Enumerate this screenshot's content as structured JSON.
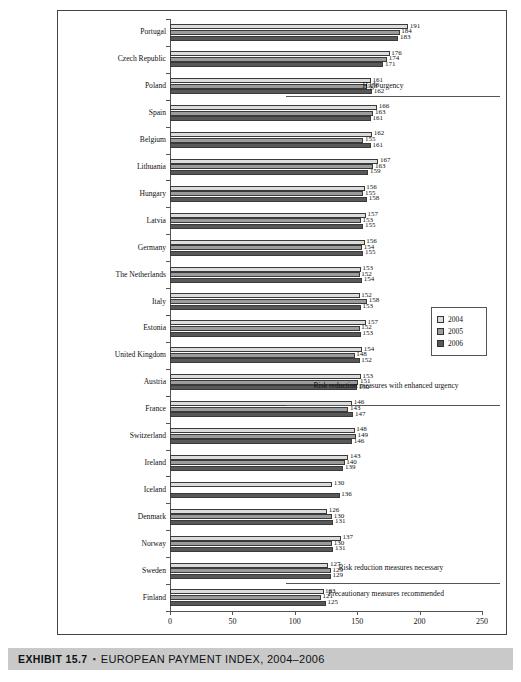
{
  "caption": {
    "exhibit_label": "EXHIBIT 15.7",
    "separator": "▪",
    "title": "EUROPEAN PAYMENT INDEX, 2004–2006"
  },
  "legend": {
    "position": "right-middle",
    "items": [
      {
        "label": "2004",
        "color": "#dcdcdc"
      },
      {
        "label": "2005",
        "color": "#9c9c9c"
      },
      {
        "label": "2006",
        "color": "#585858"
      }
    ]
  },
  "annotations": [
    {
      "name": "high-urgency",
      "text": "High urgency"
    },
    {
      "name": "risk-reduction-enhanced",
      "text": "Risk reduction measures with enhanced urgency"
    },
    {
      "name": "risk-reduction-necessary",
      "text": "Risk reduction measures necessary"
    },
    {
      "name": "precautionary",
      "text": "Precautionary measures recommended"
    }
  ],
  "chart_data": {
    "type": "bar",
    "orientation": "horizontal",
    "xlabel": "",
    "ylabel": "",
    "xlim": [
      0,
      250
    ],
    "xticks": [
      0,
      50,
      100,
      150,
      200,
      250
    ],
    "grid": false,
    "legend_position": "right",
    "categories": [
      "Portugal",
      "Czech Republic",
      "Poland",
      "Spain",
      "Belgium",
      "Lithuania",
      "Hungary",
      "Latvia",
      "Germany",
      "The Netherlands",
      "Italy",
      "Estonia",
      "United Kingdom",
      "Austria",
      "France",
      "Switzerland",
      "Ireland",
      "Iceland",
      "Denmark",
      "Norway",
      "Sweden",
      "Finland"
    ],
    "series": [
      {
        "name": "2004",
        "color": "#dcdcdc",
        "values": [
          191,
          176,
          161,
          166,
          162,
          167,
          156,
          157,
          156,
          153,
          152,
          157,
          154,
          153,
          146,
          148,
          143,
          130,
          126,
          137,
          127,
          123
        ]
      },
      {
        "name": "2005",
        "color": "#9c9c9c",
        "values": [
          184,
          174,
          158,
          163,
          155,
          163,
          155,
          153,
          154,
          152,
          158,
          152,
          148,
          151,
          143,
          149,
          140,
          null,
          130,
          130,
          129,
          121
        ]
      },
      {
        "name": "2006",
        "color": "#585858",
        "values": [
          183,
          171,
          162,
          161,
          161,
          159,
          158,
          155,
          155,
          154,
          153,
          153,
          152,
          150,
          147,
          146,
          139,
          136,
          131,
          131,
          129,
          125
        ]
      }
    ]
  }
}
